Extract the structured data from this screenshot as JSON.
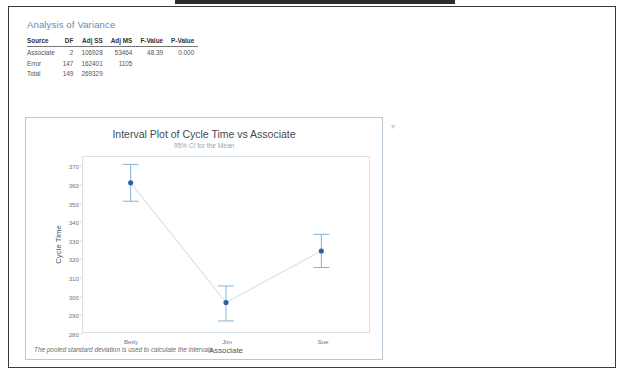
{
  "document": {
    "anova": {
      "title": "Analysis of Variance",
      "columns": [
        "Source",
        "DF",
        "Adj SS",
        "Adj MS",
        "F-Value",
        "P-Value"
      ],
      "rows": [
        {
          "source": "Associate",
          "df": "2",
          "adj_ss": "106928",
          "adj_ms": "53464",
          "f_value": "48.39",
          "p_value": "0.000"
        },
        {
          "source": "Error",
          "df": "147",
          "adj_ss": "162401",
          "adj_ms": "1105",
          "f_value": "",
          "p_value": ""
        },
        {
          "source": "Total",
          "df": "149",
          "adj_ss": "269329",
          "adj_ms": "",
          "f_value": "",
          "p_value": ""
        }
      ]
    },
    "chart_footnote": "The pooled standard deviation is used to calculate the intervals.",
    "chevron_icon": "▾"
  },
  "chart_data": {
    "type": "line",
    "title": "Interval Plot of Cycle Time vs Associate",
    "subtitle": "95% CI for the Mean",
    "xlabel": "Associate",
    "ylabel": "Cycle Time",
    "categories": [
      "Betty",
      "Jim",
      "Sue"
    ],
    "values": [
      361,
      296,
      324
    ],
    "ci_lower": [
      351,
      286,
      315
    ],
    "ci_upper": [
      371,
      305,
      333
    ],
    "ylim": [
      280,
      375
    ],
    "yticks": [
      280,
      290,
      300,
      310,
      320,
      330,
      340,
      350,
      360,
      370
    ],
    "grid": false,
    "legend": "none",
    "series_color": "#2f5f9e",
    "error_bar_color": "#7fb2dd",
    "connector_color": "#dfe7ef"
  }
}
